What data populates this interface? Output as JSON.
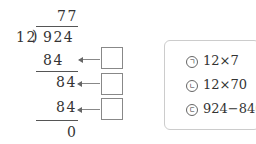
{
  "division": {
    "quotient": "77",
    "divisor": "12",
    "dividend": "924",
    "steps": [
      {
        "value": "84"
      },
      {
        "value": "84"
      },
      {
        "value": "84"
      }
    ],
    "remainder": "0"
  },
  "answer_boxes": [
    "",
    "",
    ""
  ],
  "options": [
    {
      "marker": "ㄱ",
      "expression": "12×7"
    },
    {
      "marker": "ㄴ",
      "expression": "12×70"
    },
    {
      "marker": "ㄷ",
      "expression": "924−840"
    }
  ]
}
